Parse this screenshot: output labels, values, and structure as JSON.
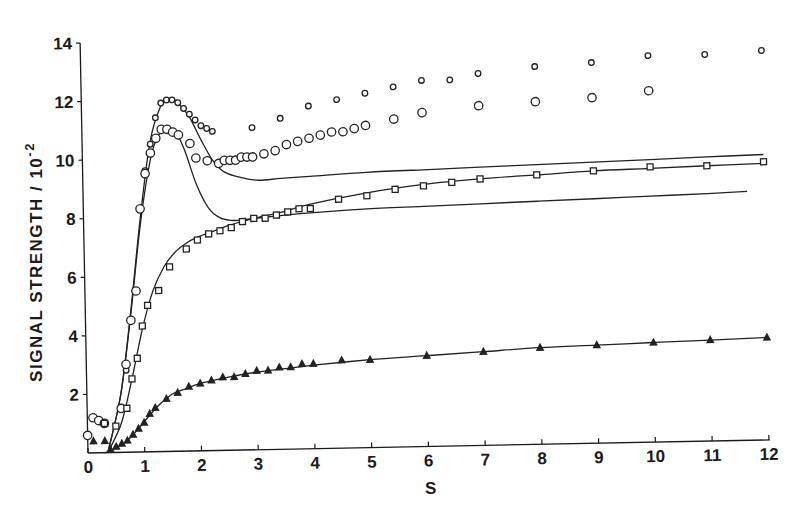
{
  "chart_data": {
    "type": "scatter",
    "title": "",
    "xlabel": "S",
    "ylabel": "SIGNAL   STRENGTH / 10",
    "ylabel_superscript": "-2",
    "xlim": [
      0,
      12
    ],
    "ylim": [
      0,
      14
    ],
    "x_ticks": [
      0,
      1,
      2,
      3,
      4,
      5,
      6,
      7,
      8,
      9,
      10,
      11,
      12
    ],
    "y_ticks": [
      2,
      4,
      6,
      8,
      10,
      12,
      14
    ],
    "grid": false,
    "legend": "none",
    "series": [
      {
        "name": "diamonds",
        "marker": "diamond",
        "x": [
          0.7,
          0.9,
          1.0,
          1.1,
          1.2,
          1.3,
          1.4,
          1.5,
          1.6,
          1.7,
          1.8,
          1.9,
          2.0,
          2.1,
          2.2,
          2.3,
          3.0,
          3.5,
          4.0,
          4.5,
          5.0,
          5.5,
          6.0,
          6.5,
          7.0,
          8.0,
          9.0,
          10.0,
          11.0,
          12.0
        ],
        "values": [
          2.8,
          5.5,
          8.3,
          9.6,
          10.5,
          11.4,
          11.9,
          12.0,
          12.0,
          11.9,
          11.7,
          11.5,
          11.3,
          11.1,
          11.0,
          10.9,
          11.0,
          11.3,
          11.7,
          11.9,
          12.1,
          12.3,
          12.5,
          12.5,
          12.7,
          12.9,
          13.0,
          13.2,
          13.2,
          13.3
        ]
      },
      {
        "name": "circles",
        "marker": "circle",
        "x": [
          0.0,
          0.1,
          0.2,
          0.3,
          0.6,
          0.7,
          0.8,
          0.9,
          1.0,
          1.1,
          1.2,
          1.3,
          1.4,
          1.5,
          1.6,
          1.7,
          1.9,
          2.0,
          2.2,
          2.4,
          2.5,
          2.6,
          2.7,
          2.8,
          2.9,
          3.0,
          3.2,
          3.4,
          3.6,
          3.8,
          4.0,
          4.2,
          4.4,
          4.6,
          4.8,
          5.0,
          5.5,
          6.0,
          7.0,
          8.0,
          9.0,
          10.0
        ],
        "values": [
          0.6,
          1.2,
          1.1,
          1.0,
          1.5,
          3.0,
          4.5,
          5.5,
          8.3,
          9.5,
          10.2,
          10.7,
          11.0,
          11.0,
          10.9,
          10.8,
          10.5,
          10.0,
          9.9,
          9.8,
          9.9,
          9.9,
          9.9,
          10.0,
          10.0,
          10.0,
          10.1,
          10.2,
          10.4,
          10.5,
          10.6,
          10.7,
          10.8,
          10.8,
          10.9,
          11.0,
          11.2,
          11.4,
          11.6,
          11.7,
          11.8,
          12.0
        ]
      },
      {
        "name": "squares",
        "marker": "square",
        "x": [
          0.3,
          0.5,
          0.7,
          0.8,
          0.9,
          1.0,
          1.1,
          1.3,
          1.5,
          1.8,
          2.0,
          2.2,
          2.4,
          2.6,
          2.8,
          3.0,
          3.2,
          3.4,
          3.6,
          3.8,
          4.0,
          4.5,
          5.0,
          5.5,
          6.0,
          6.5,
          7.0,
          8.0,
          9.0,
          10.0,
          11.0,
          12.0
        ],
        "values": [
          1.0,
          0.9,
          1.5,
          2.5,
          3.2,
          4.3,
          5.0,
          5.5,
          6.3,
          6.9,
          7.2,
          7.4,
          7.5,
          7.6,
          7.8,
          7.9,
          7.9,
          8.0,
          8.1,
          8.2,
          8.2,
          8.5,
          8.6,
          8.8,
          8.9,
          9.0,
          9.1,
          9.2,
          9.3,
          9.4,
          9.4,
          9.5
        ]
      },
      {
        "name": "triangles",
        "marker": "triangle",
        "x": [
          0.1,
          0.3,
          0.4,
          0.5,
          0.6,
          0.7,
          0.8,
          0.9,
          1.0,
          1.1,
          1.2,
          1.4,
          1.6,
          1.8,
          2.0,
          2.2,
          2.4,
          2.6,
          2.8,
          3.0,
          3.2,
          3.4,
          3.6,
          3.8,
          4.0,
          4.5,
          5.0,
          6.0,
          7.0,
          8.0,
          9.0,
          10.0,
          11.0,
          12.0
        ],
        "values": [
          0.4,
          0.4,
          0.1,
          0.2,
          0.3,
          0.4,
          0.6,
          0.8,
          1.0,
          1.3,
          1.5,
          1.8,
          2.0,
          2.2,
          2.3,
          2.4,
          2.5,
          2.5,
          2.6,
          2.7,
          2.7,
          2.8,
          2.8,
          2.9,
          2.9,
          3.0,
          3.0,
          3.1,
          3.2,
          3.3,
          3.35,
          3.4,
          3.45,
          3.5
        ]
      }
    ],
    "fit_curves": [
      {
        "name": "fit-upper",
        "x": [
          0.35,
          0.6,
          0.8,
          1.0,
          1.2,
          1.4,
          1.55,
          1.7,
          1.9,
          2.1,
          2.3,
          2.5,
          2.8,
          3.1,
          3.5,
          4.0,
          5.0,
          6.0,
          7.0,
          8.0,
          9.0,
          10.0,
          11.0,
          12.0
        ],
        "values": [
          0.0,
          2.0,
          4.8,
          8.0,
          10.6,
          11.8,
          12.05,
          11.9,
          11.4,
          10.6,
          9.9,
          9.5,
          9.3,
          9.2,
          9.25,
          9.3,
          9.4,
          9.45,
          9.5,
          9.55,
          9.6,
          9.65,
          9.7,
          9.75
        ]
      },
      {
        "name": "fit-middle",
        "x": [
          0.35,
          0.6,
          0.8,
          1.0,
          1.2,
          1.35,
          1.5,
          1.65,
          1.8,
          2.0,
          2.2,
          2.4,
          2.6,
          2.8,
          3.0,
          3.3,
          3.6,
          4.0,
          5.0,
          6.0,
          7.0,
          8.0,
          9.0,
          10.0,
          11.0,
          11.7
        ],
        "values": [
          0.0,
          2.0,
          4.7,
          7.8,
          10.0,
          10.8,
          11.0,
          10.9,
          10.3,
          9.1,
          8.3,
          7.95,
          7.85,
          7.85,
          7.9,
          7.95,
          8.0,
          8.05,
          8.15,
          8.2,
          8.25,
          8.3,
          8.35,
          8.4,
          8.45,
          8.5
        ]
      },
      {
        "name": "fit-squares",
        "x": [
          0.35,
          0.6,
          0.8,
          1.0,
          1.2,
          1.4,
          1.6,
          1.8,
          2.0,
          2.3,
          2.6,
          3.0,
          3.5,
          4.0,
          5.0,
          6.0,
          7.0,
          8.0,
          9.0,
          10.0,
          11.0,
          12.0
        ],
        "values": [
          0.0,
          1.0,
          2.5,
          4.2,
          5.5,
          6.3,
          6.8,
          7.1,
          7.3,
          7.5,
          7.7,
          7.9,
          8.1,
          8.35,
          8.7,
          8.95,
          9.1,
          9.2,
          9.3,
          9.35,
          9.4,
          9.45
        ]
      },
      {
        "name": "fit-triangles",
        "x": [
          0.3,
          0.5,
          0.7,
          0.9,
          1.1,
          1.3,
          1.5,
          1.7,
          2.0,
          2.5,
          3.0,
          3.5,
          4.0,
          5.0,
          6.0,
          7.0,
          8.0,
          9.0,
          10.0,
          11.0,
          12.0
        ],
        "values": [
          0.0,
          0.15,
          0.4,
          0.8,
          1.25,
          1.65,
          1.95,
          2.1,
          2.3,
          2.5,
          2.65,
          2.75,
          2.85,
          3.0,
          3.1,
          3.2,
          3.3,
          3.35,
          3.4,
          3.45,
          3.5
        ]
      }
    ]
  }
}
